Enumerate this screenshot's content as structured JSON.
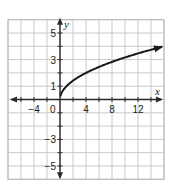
{
  "chart_data": {
    "type": "line",
    "title": "",
    "xlabel": "x",
    "ylabel": "y",
    "xlim": [
      -8,
      16
    ],
    "ylim": [
      -6,
      6
    ],
    "x_ticks_labeled": [
      -4,
      0,
      4,
      8,
      12
    ],
    "y_ticks_labeled": [
      5,
      3,
      1,
      -3,
      -5
    ],
    "x_grid_step": 2,
    "y_grid_step": 1,
    "grid": true,
    "axes_arrows": true,
    "series": [
      {
        "name": "y = sqrt(x)",
        "function": "sqrt(x)",
        "domain_start": 0,
        "end_arrow": true,
        "x": [
          0,
          0.25,
          1,
          2,
          4,
          6,
          8,
          10,
          12,
          14,
          15.7
        ],
        "values": [
          0.3,
          0.55,
          1.0,
          1.41,
          2.0,
          2.45,
          2.83,
          3.16,
          3.46,
          3.74,
          3.96
        ]
      }
    ]
  },
  "labels": {
    "x_axis": "x",
    "y_axis": "y",
    "origin": "0",
    "x_ticks": [
      "−4",
      "4",
      "8",
      "12"
    ],
    "y_ticks": [
      "5",
      "3",
      "1",
      "−3",
      "−5"
    ]
  },
  "colors": {
    "grid": "#c9c9c9",
    "border": "#b8b8b8",
    "axis": "#2a2a2a",
    "curve": "#1a1a1a"
  }
}
